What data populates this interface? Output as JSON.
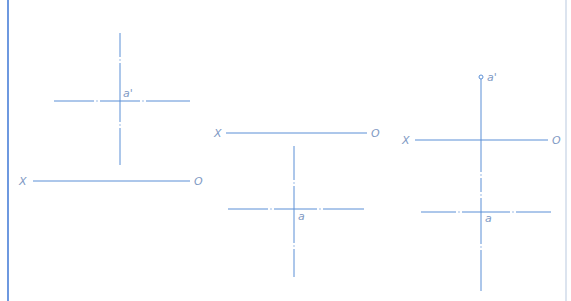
{
  "colors": {
    "line": "#5b8fd6",
    "label": "#7f9ac4",
    "left_border": "#4a7fd8",
    "right_border": "#cdd9e8",
    "background": "#ffffff"
  },
  "frame": {
    "left_border_x": 8,
    "right_border_x": 566
  },
  "panels": [
    {
      "id": "panel-1",
      "xo_axis": {
        "y": 181,
        "x1": 33,
        "x2": 190,
        "label_x": "X",
        "label_o": "O",
        "label_x_pos": [
          19,
          185
        ],
        "label_o_pos": [
          194,
          185
        ]
      },
      "vertical": {
        "x": 120,
        "y1": 33,
        "y2": 165,
        "style": "dashdot",
        "breaks": [
          60,
          125
        ]
      },
      "horizontal": {
        "y": 101,
        "x1": 54,
        "x2": 190,
        "style": "dashdot",
        "breaks": [
          97,
          143
        ]
      },
      "point": {
        "label": "a'",
        "label_pos": [
          123,
          97
        ]
      }
    },
    {
      "id": "panel-2",
      "xo_axis": {
        "y": 133,
        "x1": 226,
        "x2": 367,
        "label_x": "X",
        "label_o": "O",
        "label_x_pos": [
          214,
          137
        ],
        "label_o_pos": [
          371,
          137
        ]
      },
      "vertical": {
        "x": 294,
        "y1": 146,
        "y2": 277,
        "style": "dashdot",
        "breaks": [
          183,
          246
        ]
      },
      "horizontal": {
        "y": 209,
        "x1": 228,
        "x2": 364,
        "style": "dashdot",
        "breaks": [
          271,
          320
        ]
      },
      "point": {
        "label": "a",
        "label_pos": [
          298,
          220
        ]
      }
    },
    {
      "id": "panel-3",
      "xo_axis": {
        "y": 140,
        "x1": 415,
        "x2": 548,
        "label_x": "X",
        "label_o": "O",
        "label_x_pos": [
          402,
          144
        ],
        "label_o_pos": [
          552,
          144
        ]
      },
      "vertical": {
        "x": 481,
        "y1": 79,
        "y2": 291,
        "style": "mixed",
        "solid_until": 160,
        "breaks": [
          175,
          195,
          247
        ]
      },
      "horizontal": {
        "y": 212,
        "x1": 421,
        "x2": 551,
        "style": "dashdot",
        "breaks": [
          459,
          513
        ]
      },
      "point_top": {
        "label": "a'",
        "circle": [
          481,
          77
        ],
        "label_pos": [
          487,
          81
        ]
      },
      "point": {
        "label": "a",
        "label_pos": [
          485,
          222
        ]
      }
    }
  ]
}
